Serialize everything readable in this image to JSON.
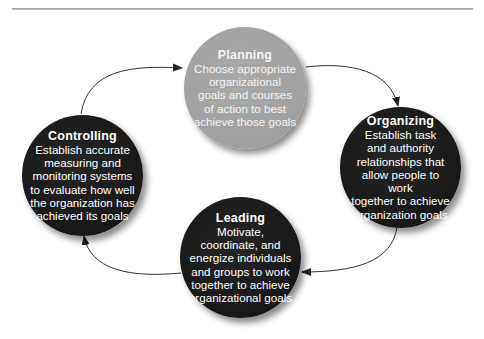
{
  "diagram": {
    "type": "cycle",
    "colors": {
      "dark_node": "#1c1c1c",
      "light_node": "#a3a3a3",
      "arrow": "#333333",
      "rule": "#a8a8a8"
    },
    "nodes": [
      {
        "id": "planning",
        "title": "Planning",
        "description": "Choose appropriate\norganizational\ngoals and courses\nof action to best\nachieve those goals"
      },
      {
        "id": "organizing",
        "title": "Organizing",
        "description": "Establish task\nand authority\nrelationships that\nallow people to work\ntogether to achieve\norganization goals"
      },
      {
        "id": "leading",
        "title": "Leading",
        "description": "Motivate,\ncoordinate, and\nenergize individuals\nand groups to work\ntogether to achieve\norganizational goals"
      },
      {
        "id": "controlling",
        "title": "Controlling",
        "description": "Establish accurate\nmeasuring and\nmonitoring systems\nto evaluate how well\nthe organization has\nachieved its goals"
      }
    ],
    "edges": [
      {
        "from": "planning",
        "to": "organizing"
      },
      {
        "from": "organizing",
        "to": "leading"
      },
      {
        "from": "leading",
        "to": "controlling"
      },
      {
        "from": "controlling",
        "to": "planning"
      }
    ]
  }
}
